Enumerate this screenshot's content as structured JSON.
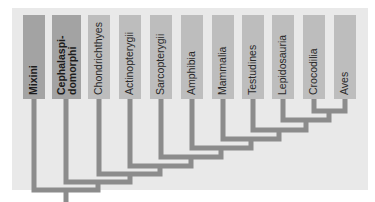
{
  "diagram": {
    "type": "cladogram",
    "colors": {
      "panel_bg": "#e9e9e9",
      "tile_light": "#bdbdbd",
      "tile_dark": "#a3a3a3",
      "branch": "#8c8c8c"
    },
    "taxa": [
      {
        "label": "Mixini",
        "emphasis": true
      },
      {
        "label": "Cephalaspi-\ndomorphi",
        "emphasis": true
      },
      {
        "label": "Chondrichthyes",
        "emphasis": false
      },
      {
        "label": "Actinopterygii",
        "emphasis": false
      },
      {
        "label": "Sarcopterygii",
        "emphasis": false
      },
      {
        "label": "Amphibia",
        "emphasis": false
      },
      {
        "label": "Mammalia",
        "emphasis": false
      },
      {
        "label": "Testudines",
        "emphasis": false
      },
      {
        "label": "Lepidosauria",
        "emphasis": false
      },
      {
        "label": "Crocodilia",
        "emphasis": false
      },
      {
        "label": "Aves",
        "emphasis": false
      }
    ],
    "topology": "(Mixini,(Cephalaspidomorphi,(Chondrichthyes,(Actinopterygii,(Sarcopterygii,(Amphibia,(Mammalia,(Testudines,(Lepidosauria,(Crocodilia,Aves))))))))))"
  }
}
